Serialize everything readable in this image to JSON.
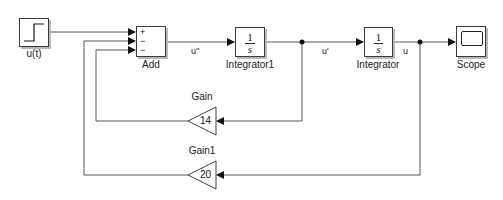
{
  "diagram": {
    "blocks": {
      "step": {
        "label": "u(t)"
      },
      "add": {
        "label": "Add",
        "signs": [
          "+",
          "−",
          "−"
        ]
      },
      "integrator1": {
        "label": "Integrator1",
        "numerator": "1",
        "denominator": "s"
      },
      "integrator": {
        "label": "Integrator",
        "numerator": "1",
        "denominator": "s"
      },
      "scope": {
        "label": "Scope"
      },
      "gain": {
        "label": "Gain",
        "value": "14"
      },
      "gain1": {
        "label": "Gain1",
        "value": "20"
      }
    },
    "signals": {
      "add_out": "u''",
      "integrator1_out": "u'",
      "integrator_out": "u"
    },
    "colors": {
      "line": "#555555",
      "block_border": "#3a3a3a",
      "shadow": "#b8b8b8"
    }
  }
}
